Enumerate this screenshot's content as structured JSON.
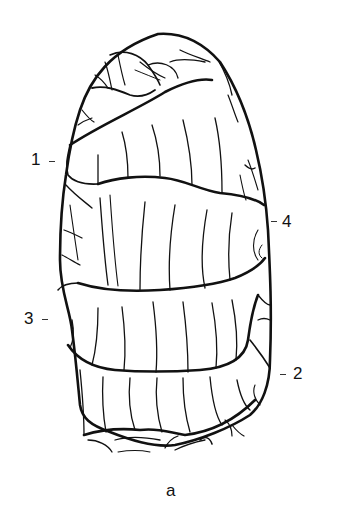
{
  "figure": {
    "caption": "a",
    "labels": [
      {
        "id": "1",
        "text": "1"
      },
      {
        "id": "2",
        "text": "2"
      },
      {
        "id": "3",
        "text": "3"
      },
      {
        "id": "4",
        "text": "4"
      }
    ],
    "line_color": "#111111",
    "background": "#ffffff"
  }
}
